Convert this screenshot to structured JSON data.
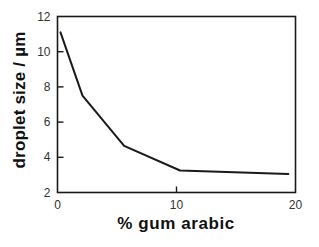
{
  "chart_data": {
    "type": "line",
    "title": "",
    "xlabel": "% gum arabic",
    "ylabel": "droplet size / µm",
    "xlim": [
      0,
      20
    ],
    "ylim": [
      2,
      12
    ],
    "xticks": [
      0,
      10,
      20
    ],
    "xtick_labels": [
      "0",
      "10",
      "20"
    ],
    "yticks": [
      2,
      4,
      6,
      8,
      10,
      12
    ],
    "ytick_labels": [
      "2",
      "4",
      "6",
      "8",
      "10",
      "12"
    ],
    "grid": false,
    "legend": false,
    "legend_position": "none",
    "line_color": "#1a1a1a",
    "line_width": 2,
    "frame_color": "#1a1a1a",
    "background": "#ffffff",
    "series": [
      {
        "name": "droplet size",
        "x": [
          0.25,
          2.1,
          5.6,
          10.3,
          19.4
        ],
        "values": [
          11.1,
          7.5,
          4.65,
          3.25,
          3.05
        ]
      }
    ]
  },
  "axis_titles": {
    "x": "% gum arabic",
    "y": "droplet size / µm"
  }
}
